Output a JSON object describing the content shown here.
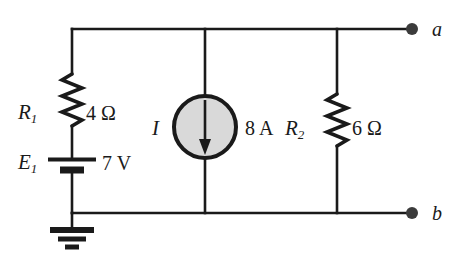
{
  "figure": {
    "kind": "circuit-schematic",
    "background_color": "#ffffff",
    "line_color": "#1a1a1a",
    "source_fill_color": "#d9d9d9"
  },
  "components": {
    "r1": {
      "symbol": "R",
      "subscript": "1",
      "value": "4 Ω",
      "type": "resistor"
    },
    "e1": {
      "symbol": "E",
      "subscript": "1",
      "value": "7 V",
      "type": "voltage-source-battery"
    },
    "current_source": {
      "symbol": "I",
      "value": "8 A",
      "type": "current-source",
      "arrow_direction": "down"
    },
    "r2": {
      "symbol": "R",
      "subscript": "2",
      "value": "6 Ω",
      "type": "resistor"
    },
    "ground": {
      "type": "earth-ground"
    }
  },
  "terminals": {
    "a": "a",
    "b": "b"
  }
}
